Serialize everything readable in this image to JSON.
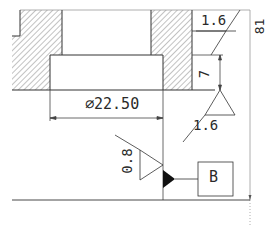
{
  "drawing": {
    "dimensions": {
      "diameter": "∅22.50",
      "depth": "7",
      "overall_height": "81"
    },
    "surface_finish": {
      "top": "1.6",
      "bore": "1.6",
      "side": "0.8"
    },
    "datum": {
      "label": "B"
    }
  },
  "colors": {
    "line": "#333333",
    "hatch": "#555555",
    "thin": "#888888",
    "background": "#ffffff"
  }
}
